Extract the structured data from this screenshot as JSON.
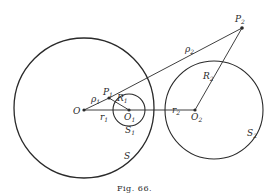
{
  "figure": {
    "caption": "Fig. 66.",
    "points": {
      "O": {
        "label": "O"
      },
      "O1": {
        "label": "O",
        "sub": "1"
      },
      "O2": {
        "label": "O",
        "sub": "2"
      },
      "P1": {
        "label": "P",
        "sub": "1"
      },
      "P2": {
        "label": "P",
        "sub": "2"
      }
    },
    "circles": {
      "S": {
        "label": "S"
      },
      "S1": {
        "label": "S",
        "sub": "1"
      },
      "S2": {
        "label": "S",
        "sub": "2"
      }
    },
    "segments": {
      "rho1": {
        "label": "ρ",
        "sub": "1"
      },
      "rho2": {
        "label": "ρ",
        "sub": "2"
      },
      "r1": {
        "label": "r",
        "sub": "1"
      },
      "r2": {
        "label": "r",
        "sub": "2"
      },
      "R1": {
        "label": "R",
        "sub": "1"
      },
      "R2": {
        "label": "R",
        "sub": "2"
      }
    }
  }
}
